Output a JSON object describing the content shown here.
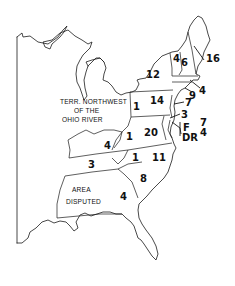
{
  "map": {
    "territory_label": [
      "TERR. NORTHWEST",
      "OF THE",
      "OHIO RIVER"
    ],
    "disputed_label": [
      "AREA",
      "DISPUTED"
    ],
    "regions": [
      {
        "name": "maine-massachusetts",
        "value": "16"
      },
      {
        "name": "vermont",
        "value": "4"
      },
      {
        "name": "new-hampshire",
        "value": "6"
      },
      {
        "name": "new-york",
        "value": "12"
      },
      {
        "name": "rhode-island",
        "value": "4"
      },
      {
        "name": "connecticut",
        "value": "9"
      },
      {
        "name": "new-jersey",
        "value": "7"
      },
      {
        "name": "delaware",
        "value": "3"
      },
      {
        "name": "pennsylvania-west",
        "value": "1"
      },
      {
        "name": "pennsylvania",
        "value": "14"
      },
      {
        "name": "maryland-federalist",
        "value": "7"
      },
      {
        "name": "maryland-democratic-republican",
        "value": "4"
      },
      {
        "name": "virginia-west",
        "value": "1"
      },
      {
        "name": "virginia",
        "value": "20"
      },
      {
        "name": "kentucky",
        "value": "4"
      },
      {
        "name": "tennessee",
        "value": "3"
      },
      {
        "name": "north-carolina-west",
        "value": "1"
      },
      {
        "name": "north-carolina",
        "value": "11"
      },
      {
        "name": "south-carolina",
        "value": "8"
      },
      {
        "name": "georgia",
        "value": "4"
      }
    ],
    "party_labels": {
      "federalist": "F",
      "democratic_republican": "DR"
    }
  }
}
